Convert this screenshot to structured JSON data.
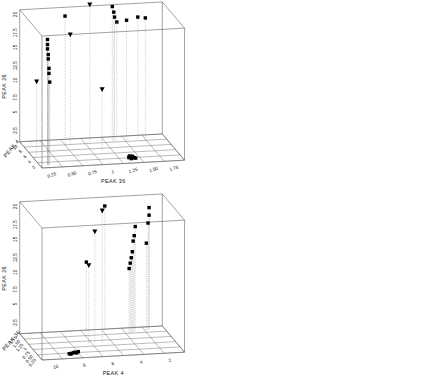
{
  "figure": {
    "background": "#ffffff",
    "line_color": "#555555",
    "marker_color": "#000000",
    "panel_count": 4
  },
  "chart_data": [
    {
      "type": "scatter",
      "title": "",
      "projection": "3d",
      "panel": "top-left",
      "xlabel": "PEAK 36",
      "ylabel": "PEAK 4",
      "zlabel": "PEAK 26",
      "xticks": [
        "0.25",
        "0.50",
        "0.75",
        "1",
        "1.25",
        "1.50",
        "1.75"
      ],
      "yticks": [
        "2",
        "4",
        "6",
        "8",
        "10"
      ],
      "zticks": [
        "2.5",
        "5",
        "7.5",
        "10",
        "12.5",
        "15",
        "17.5",
        "20"
      ],
      "xlim": [
        0,
        1.9
      ],
      "ylim": [
        0,
        11
      ],
      "zlim": [
        0,
        21
      ],
      "x_reversed": false,
      "grid": true,
      "legend": "none",
      "series": [
        {
          "name": "square-group",
          "marker": "square",
          "points": [
            {
              "x": 0.1,
              "y": 1.0,
              "z": 20.0
            },
            {
              "x": 0.1,
              "y": 1.0,
              "z": 19.2
            },
            {
              "x": 0.1,
              "y": 1.0,
              "z": 18.5
            },
            {
              "x": 0.11,
              "y": 1.0,
              "z": 17.6
            },
            {
              "x": 0.11,
              "y": 1.0,
              "z": 16.9
            },
            {
              "x": 0.12,
              "y": 1.0,
              "z": 15.4
            },
            {
              "x": 0.12,
              "y": 1.0,
              "z": 14.6
            },
            {
              "x": 0.13,
              "y": 1.0,
              "z": 13.2
            },
            {
              "x": 0.55,
              "y": 9.0,
              "z": 20.4
            },
            {
              "x": 1.18,
              "y": 9.0,
              "z": 21.5
            },
            {
              "x": 1.2,
              "y": 9.0,
              "z": 20.6
            },
            {
              "x": 1.21,
              "y": 9.0,
              "z": 19.8
            },
            {
              "x": 1.24,
              "y": 9.0,
              "z": 19.0
            },
            {
              "x": 1.37,
              "y": 9.0,
              "z": 19.2
            },
            {
              "x": 1.52,
              "y": 9.0,
              "z": 19.6
            },
            {
              "x": 1.62,
              "y": 9.0,
              "z": 19.4
            },
            {
              "x": 1.22,
              "y": 2.2,
              "z": 0.0
            },
            {
              "x": 1.25,
              "y": 2.0,
              "z": 0.0
            },
            {
              "x": 1.27,
              "y": 2.3,
              "z": 0.0
            },
            {
              "x": 1.24,
              "y": 1.8,
              "z": 0.0
            },
            {
              "x": 1.29,
              "y": 2.1,
              "z": 0.0
            },
            {
              "x": 1.26,
              "y": 2.4,
              "z": 0.0
            },
            {
              "x": 1.23,
              "y": 2.6,
              "z": 0.0
            },
            {
              "x": 1.3,
              "y": 1.9,
              "z": 0.0
            },
            {
              "x": 1.28,
              "y": 2.7,
              "z": 0.0
            },
            {
              "x": 1.25,
              "y": 2.9,
              "z": 0.0
            }
          ]
        },
        {
          "name": "triangle-group",
          "marker": "triangle-down",
          "points": [
            {
              "x": 0.88,
              "y": 9.0,
              "z": 22.0
            },
            {
              "x": 0.62,
              "y": 9.0,
              "z": 17.4
            },
            {
              "x": 0.05,
              "y": 4.5,
              "z": 12.0
            },
            {
              "x": 0.95,
              "y": 5.5,
              "z": 9.8
            }
          ]
        }
      ]
    },
    {
      "type": "scatter",
      "title": "",
      "projection": "3d",
      "panel": "top-right",
      "xlabel": "PEAK 4",
      "ylabel": "PEAK 36",
      "zlabel": "PEAK 26",
      "xticks": [
        "10",
        "8",
        "6",
        "4",
        "2"
      ],
      "yticks": [
        "0.25",
        "0.50",
        "0.75",
        "1",
        "1.25",
        "1.50",
        "1.75"
      ],
      "zticks": [
        "2.5",
        "5",
        "7.5",
        "10",
        "12.5",
        "15",
        "17.5",
        "20"
      ],
      "xlim": [
        11,
        0
      ],
      "ylim": [
        0,
        1.9
      ],
      "zlim": [
        0,
        21
      ],
      "x_reversed": true,
      "grid": true,
      "legend": "none",
      "series": [
        {
          "name": "square-group",
          "marker": "square",
          "points": [
            {
              "x": 6.0,
              "y": 1.0,
              "z": 19.6
            },
            {
              "x": 6.0,
              "y": 1.0,
              "z": 18.8
            },
            {
              "x": 6.0,
              "y": 1.0,
              "z": 17.9
            },
            {
              "x": 6.0,
              "y": 1.0,
              "z": 16.8
            },
            {
              "x": 6.0,
              "y": 1.0,
              "z": 15.9
            },
            {
              "x": 6.0,
              "y": 1.0,
              "z": 13.2
            },
            {
              "x": 6.0,
              "y": 1.0,
              "z": 12.4
            },
            {
              "x": 6.0,
              "y": 1.0,
              "z": 11.5
            },
            {
              "x": 4.0,
              "y": 1.0,
              "z": 18.2
            },
            {
              "x": 2.2,
              "y": 1.0,
              "z": 18.6
            },
            {
              "x": 2.3,
              "y": 1.0,
              "z": 17.1
            },
            {
              "x": 2.4,
              "y": 1.0,
              "z": 16.4
            },
            {
              "x": 1.6,
              "y": 1.0,
              "z": 14.8
            },
            {
              "x": 1.2,
              "y": 1.0,
              "z": 14.2
            },
            {
              "x": 0.8,
              "y": 1.0,
              "z": 13.4
            },
            {
              "x": 8.6,
              "y": 1.25,
              "z": 0.0
            },
            {
              "x": 8.4,
              "y": 1.3,
              "z": 0.0
            },
            {
              "x": 8.2,
              "y": 1.27,
              "z": 0.0
            },
            {
              "x": 8.5,
              "y": 1.22,
              "z": 0.0
            },
            {
              "x": 8.0,
              "y": 1.33,
              "z": 0.0
            },
            {
              "x": 8.3,
              "y": 1.36,
              "z": 0.0
            },
            {
              "x": 7.9,
              "y": 1.24,
              "z": 0.0
            }
          ]
        },
        {
          "name": "triangle-group",
          "marker": "triangle-down",
          "points": [
            {
              "x": 6.2,
              "y": 1.0,
              "z": 21.4
            },
            {
              "x": 7.8,
              "y": 1.0,
              "z": 17.2
            },
            {
              "x": 9.6,
              "y": 1.0,
              "z": 14.4
            },
            {
              "x": 7.6,
              "y": 1.0,
              "z": 10.2
            }
          ]
        }
      ]
    },
    {
      "type": "scatter",
      "title": "",
      "projection": "3d",
      "panel": "bottom-left",
      "xlabel": "PEAK 4",
      "ylabel": "PEAK 36",
      "zlabel": "PEAK 26",
      "xticks": [
        "10",
        "8",
        "6",
        "4",
        "2"
      ],
      "yticks": [
        "0.25",
        "0.50",
        "0.75",
        "1",
        "1.25",
        "1.50",
        "1.75"
      ],
      "zticks": [
        "2.5",
        "5",
        "7.5",
        "10",
        "12.5",
        "15",
        "17.5",
        "20"
      ],
      "xlim": [
        11,
        0
      ],
      "ylim": [
        0,
        1.9
      ],
      "zlim": [
        0,
        21
      ],
      "x_reversed": true,
      "grid": true,
      "legend": "none",
      "series": [
        {
          "name": "square-group",
          "marker": "square",
          "points": [
            {
              "x": 4.6,
              "y": 1.72,
              "z": 20.0
            },
            {
              "x": 1.2,
              "y": 1.7,
              "z": 19.4
            },
            {
              "x": 1.2,
              "y": 1.7,
              "z": 18.2
            },
            {
              "x": 1.3,
              "y": 1.68,
              "z": 17.0
            },
            {
              "x": 2.3,
              "y": 1.66,
              "z": 16.6
            },
            {
              "x": 2.4,
              "y": 1.64,
              "z": 15.2
            },
            {
              "x": 2.5,
              "y": 1.62,
              "z": 14.4
            },
            {
              "x": 1.5,
              "y": 1.6,
              "z": 14.0
            },
            {
              "x": 2.6,
              "y": 1.58,
              "z": 12.8
            },
            {
              "x": 2.7,
              "y": 1.56,
              "z": 11.9
            },
            {
              "x": 2.8,
              "y": 1.54,
              "z": 11.1
            },
            {
              "x": 6.4,
              "y": 1.3,
              "z": 12.2
            },
            {
              "x": 2.9,
              "y": 1.52,
              "z": 10.3
            },
            {
              "x": 8.4,
              "y": 0.35,
              "z": 0.0
            },
            {
              "x": 8.2,
              "y": 0.38,
              "z": 0.0
            },
            {
              "x": 8.6,
              "y": 0.33,
              "z": 0.0
            },
            {
              "x": 8.1,
              "y": 0.41,
              "z": 0.0
            },
            {
              "x": 8.5,
              "y": 0.3,
              "z": 0.0
            },
            {
              "x": 8.0,
              "y": 0.36,
              "z": 0.0
            },
            {
              "x": 7.8,
              "y": 0.44,
              "z": 0.0
            }
          ]
        },
        {
          "name": "triangle-group",
          "marker": "triangle-down",
          "points": [
            {
              "x": 5.4,
              "y": 1.05,
              "z": 20.8
            },
            {
              "x": 6.0,
              "y": 1.02,
              "z": 17.6
            },
            {
              "x": 6.5,
              "y": 0.98,
              "z": 12.4
            }
          ]
        }
      ]
    },
    {
      "type": "scatter",
      "title": "",
      "projection": "3d",
      "panel": "bottom-right",
      "xlabel": "PEAK 36",
      "ylabel": "PEAK 4",
      "zlabel": "PEAK 26",
      "xticks": [
        "1.50",
        "1.25",
        "1",
        "0.75",
        "0.50",
        "0.25",
        "0"
      ],
      "yticks": [
        "2",
        "4",
        "6",
        "8",
        "10"
      ],
      "zticks": [
        "2.5",
        "5",
        "7.5",
        "10",
        "12.5",
        "15",
        "17.5",
        "20"
      ],
      "xlim": [
        1.75,
        0
      ],
      "ylim": [
        0,
        11
      ],
      "zlim": [
        0,
        21
      ],
      "x_reversed": true,
      "grid": true,
      "legend": "none",
      "series": [
        {
          "name": "square-group",
          "marker": "square",
          "points": [
            {
              "x": 1.28,
              "y": 9.0,
              "z": 16.2
            },
            {
              "x": 1.3,
              "y": 9.0,
              "z": 15.0
            },
            {
              "x": 1.46,
              "y": 9.0,
              "z": 13.0
            },
            {
              "x": 1.48,
              "y": 9.0,
              "z": 12.4
            },
            {
              "x": 1.62,
              "y": 9.0,
              "z": 12.6
            },
            {
              "x": 1.34,
              "y": 9.0,
              "z": 12.0
            },
            {
              "x": 1.18,
              "y": 9.0,
              "z": 11.9
            },
            {
              "x": 1.16,
              "y": 9.0,
              "z": 11.2
            },
            {
              "x": 0.52,
              "y": 9.0,
              "z": 12.1
            },
            {
              "x": 0.04,
              "y": 6.0,
              "z": 11.6
            },
            {
              "x": 0.04,
              "y": 6.2,
              "z": 10.8
            },
            {
              "x": 0.04,
              "y": 6.4,
              "z": 10.1
            },
            {
              "x": 0.05,
              "y": 6.1,
              "z": 9.2
            },
            {
              "x": 0.05,
              "y": 6.3,
              "z": 8.4
            },
            {
              "x": 0.05,
              "y": 6.0,
              "z": 6.4
            },
            {
              "x": 0.05,
              "y": 6.2,
              "z": 5.6
            },
            {
              "x": 1.52,
              "y": 1.2,
              "z": 0.0
            },
            {
              "x": 1.5,
              "y": 1.3,
              "z": 0.0
            },
            {
              "x": 1.26,
              "y": 1.2,
              "z": 0.0
            },
            {
              "x": 1.24,
              "y": 1.4,
              "z": 0.0
            },
            {
              "x": 1.22,
              "y": 1.3,
              "z": 0.0
            }
          ]
        },
        {
          "name": "triangle-group",
          "marker": "triangle-down",
          "points": [
            {
              "x": 0.95,
              "y": 9.0,
              "z": 21.0
            },
            {
              "x": 0.72,
              "y": 9.0,
              "z": 18.6
            },
            {
              "x": 0.98,
              "y": 9.0,
              "z": 14.2
            },
            {
              "x": 0.3,
              "y": 9.0,
              "z": 14.8
            }
          ]
        }
      ]
    }
  ]
}
